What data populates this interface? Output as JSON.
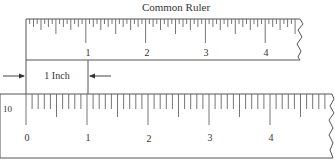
{
  "title": "Common Ruler",
  "top_ruler": {
    "name": "common-ruler",
    "subdivisions_per_inch": 16,
    "inch_labels": [
      "1",
      "2",
      "3",
      "4"
    ],
    "edge": "torn-right"
  },
  "measurement": {
    "label": "1 Inch"
  },
  "bottom_ruler": {
    "name": "decimal-ruler",
    "scale_label": "10",
    "subdivisions_per_inch": 10,
    "inch_labels": [
      "0",
      "1",
      "2",
      "3",
      "4"
    ],
    "edge": "torn-right"
  },
  "colors": {
    "line": "#555555",
    "text": "#333333",
    "background": "#ffffff"
  }
}
